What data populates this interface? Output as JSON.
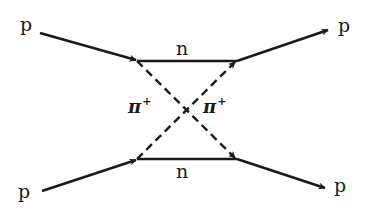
{
  "diagram": {
    "type": "feynman",
    "line_color": "#1a1a1a",
    "labels": {
      "p_in_top": "p",
      "p_in_bottom": "p",
      "p_out_top": "p",
      "p_out_bottom": "p",
      "n_top": "n",
      "n_bottom": "n",
      "pi_left": "π",
      "pi_left_charge": "+",
      "pi_right": "π",
      "pi_right_charge": "+"
    },
    "edges": [
      {
        "from": "p_in_top",
        "to": "vertex_top_left",
        "style": "solid",
        "arrow": true
      },
      {
        "from": "p_in_bottom",
        "to": "vertex_bottom_left",
        "style": "solid",
        "arrow": true
      },
      {
        "from": "vertex_top_left",
        "to": "vertex_top_right",
        "style": "solid",
        "label": "n"
      },
      {
        "from": "vertex_bottom_left",
        "to": "vertex_bottom_right",
        "style": "solid",
        "label": "n"
      },
      {
        "from": "vertex_top_left",
        "to": "vertex_bottom_right",
        "style": "dashed",
        "arrow": true,
        "label": "π+"
      },
      {
        "from": "vertex_bottom_left",
        "to": "vertex_top_right",
        "style": "dashed",
        "arrow": true,
        "label": "π+"
      },
      {
        "from": "vertex_top_right",
        "to": "p_out_top",
        "style": "solid",
        "arrow": true
      },
      {
        "from": "vertex_bottom_right",
        "to": "p_out_bottom",
        "style": "solid",
        "arrow": true
      }
    ]
  }
}
